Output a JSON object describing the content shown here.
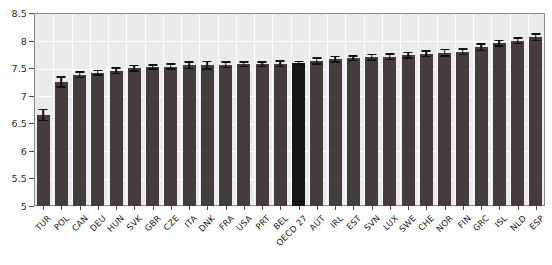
{
  "chart_data": {
    "type": "bar",
    "title": "",
    "xlabel": "",
    "ylabel": "",
    "ylim": [
      5,
      8.5
    ],
    "ytick_values": [
      5,
      5.5,
      6,
      6.5,
      7,
      7.5,
      8,
      8.5
    ],
    "ytick_labels": [
      "5",
      "5.5",
      "6",
      "6.5",
      "7",
      "7.5",
      "8",
      "8.5"
    ],
    "grid": true,
    "legend": "none",
    "bar_color": "#463c3c",
    "highlight_color": "#151515",
    "plot_background": "#ebebeb",
    "gridline_color": "#ffffff",
    "errorbar_color": "#101010",
    "highlight_category": "OECD 27",
    "categories": [
      "TUR",
      "POL",
      "CAN",
      "DEU",
      "HUN",
      "SVK",
      "GBR",
      "CZE",
      "ITA",
      "DNK",
      "FRA",
      "USA",
      "PRT",
      "BEL",
      "OECD 27",
      "AUT",
      "IRL",
      "EST",
      "SVN",
      "LUX",
      "SWE",
      "CHE",
      "NOR",
      "FIN",
      "GRC",
      "ISL",
      "NLD",
      "ESP"
    ],
    "values": [
      6.65,
      7.25,
      7.38,
      7.42,
      7.45,
      7.5,
      7.52,
      7.53,
      7.55,
      7.55,
      7.56,
      7.57,
      7.57,
      7.58,
      7.6,
      7.63,
      7.66,
      7.68,
      7.7,
      7.71,
      7.73,
      7.76,
      7.78,
      7.8,
      7.88,
      7.95,
      8.0,
      8.06
    ],
    "errors": [
      0.1,
      0.09,
      0.05,
      0.04,
      0.05,
      0.05,
      0.04,
      0.05,
      0.06,
      0.07,
      0.05,
      0.04,
      0.04,
      0.05,
      0.02,
      0.05,
      0.05,
      0.04,
      0.05,
      0.05,
      0.05,
      0.05,
      0.06,
      0.05,
      0.06,
      0.05,
      0.05,
      0.06
    ]
  }
}
